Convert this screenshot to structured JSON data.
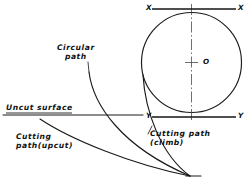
{
  "figure": {
    "style": "hand-drafted engineering line drawing",
    "background_color": "#ffffff",
    "line_color": "#1a1a1a"
  },
  "labels": {
    "circular_path": {
      "line1": "Circular",
      "line2": "path"
    },
    "uncut_surface": "Uncut surface",
    "cutting_path_upcut": {
      "line1": "Cutting",
      "line2": "path(upcut)"
    },
    "cutting_path_climb": {
      "line1": "Cutting path",
      "line2": "(climb)"
    },
    "axis_x_left": "X",
    "axis_x_right": "X",
    "axis_y_left": "Y",
    "axis_y_right": "Y",
    "center_point": "O"
  },
  "geometry": {
    "cutter_circle": {
      "center_x": 191.5,
      "center_y": 62.5,
      "radius": 50.0
    },
    "axis_line_x": {
      "x1": 152,
      "y1": 9,
      "x2": 236,
      "y2": 9
    },
    "axis_line_y": {
      "x1": 152,
      "y1": 117,
      "x2": 236,
      "y2": 117
    },
    "vertical_centerline": {
      "x": 191.5,
      "y_top": 4,
      "y_bottom": 122
    },
    "uncut_surface_line": {
      "x1": 3,
      "y1": 115,
      "x2": 143,
      "y2": 115
    },
    "convergence_point": {
      "x": 190,
      "y": 176
    },
    "exit_segment": {
      "x1": 190,
      "y1": 176,
      "x2": 201,
      "y2": 176
    }
  },
  "curves": {
    "circular_path": {
      "name": "circular path",
      "start": {
        "x": 89,
        "y": 72
      },
      "end": {
        "x": 190,
        "y": 176
      }
    },
    "cutting_path_upcut": {
      "name": "cutting path (upcut)",
      "start": {
        "x": 40,
        "y": 119
      },
      "end": {
        "x": 190,
        "y": 176
      }
    },
    "cutting_path_climb": {
      "name": "cutting path (climb)",
      "start": {
        "x": 143,
        "y": 75
      },
      "end": {
        "x": 190,
        "y": 176
      }
    }
  }
}
